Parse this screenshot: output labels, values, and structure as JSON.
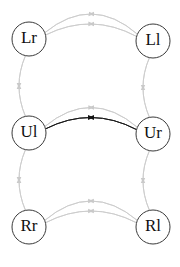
{
  "figure": {
    "title": "",
    "background_color": "#ffffff",
    "width": 180,
    "height": 267
  },
  "chart_data": {
    "type": "diagram",
    "diagram_kind": "directed-graph",
    "title": "",
    "xlabel": "",
    "ylabel": "",
    "grid": false,
    "legend": "none",
    "colors": {
      "node_stroke": "#3a3a3a",
      "node_fill": "#ffffff",
      "node_label": "#101010",
      "edge_inactive": "#cccccc",
      "edge_active": "#1a1a1a"
    },
    "nodes": [
      {
        "id": "Lr",
        "label": "Lr",
        "cx": 29,
        "cy": 39,
        "r": 17,
        "row": "top",
        "col": "left"
      },
      {
        "id": "Ll",
        "label": "Ll",
        "cx": 153,
        "cy": 41,
        "r": 17,
        "row": "top",
        "col": "right"
      },
      {
        "id": "Ul",
        "label": "Ul",
        "cx": 29,
        "cy": 133,
        "r": 17,
        "row": "middle",
        "col": "left"
      },
      {
        "id": "Ur",
        "label": "Ur",
        "cx": 153,
        "cy": 134,
        "r": 17,
        "row": "middle",
        "col": "right"
      },
      {
        "id": "Rr",
        "label": "Rr",
        "cx": 29,
        "cy": 227,
        "r": 17,
        "row": "bottom",
        "col": "left"
      },
      {
        "id": "Rl",
        "label": "Rl",
        "cx": 153,
        "cy": 227,
        "r": 17,
        "row": "bottom",
        "col": "right"
      }
    ],
    "edges": [
      {
        "id": "e1",
        "from": "Lr",
        "to": "Ll",
        "direction": "right",
        "state": "inactive",
        "curve": -26,
        "offset": 0
      },
      {
        "id": "e2",
        "from": "Lr",
        "to": "Ll",
        "direction": "right",
        "state": "inactive",
        "curve": -16,
        "offset": 0
      },
      {
        "id": "e3",
        "from": "Ll",
        "to": "Lr",
        "direction": "left",
        "state": "inactive",
        "curve": 16,
        "offset": 0
      },
      {
        "id": "e4",
        "from": "Ll",
        "to": "Lr",
        "direction": "left",
        "state": "inactive",
        "curve": 26,
        "offset": 0
      },
      {
        "id": "e5",
        "from": "Ul",
        "to": "Ur",
        "direction": "right",
        "state": "inactive",
        "curve": -26,
        "offset": 0
      },
      {
        "id": "e6",
        "from": "Ul",
        "to": "Ur",
        "direction": "right",
        "state": "active",
        "curve": -16,
        "offset": 0
      },
      {
        "id": "e7",
        "from": "Ur",
        "to": "Ul",
        "direction": "left",
        "state": "active",
        "curve": 16,
        "offset": 0
      },
      {
        "id": "e8",
        "from": "Ur",
        "to": "Ul",
        "direction": "left",
        "state": "inactive",
        "curve": 26,
        "offset": 0
      },
      {
        "id": "e9",
        "from": "Rr",
        "to": "Rl",
        "direction": "right",
        "state": "inactive",
        "curve": -26,
        "offset": 0
      },
      {
        "id": "e10",
        "from": "Rr",
        "to": "Rl",
        "direction": "right",
        "state": "inactive",
        "curve": -16,
        "offset": 0
      },
      {
        "id": "e11",
        "from": "Rl",
        "to": "Rr",
        "direction": "left",
        "state": "inactive",
        "curve": 16,
        "offset": 0
      },
      {
        "id": "e12",
        "from": "Rl",
        "to": "Rr",
        "direction": "left",
        "state": "inactive",
        "curve": 26,
        "offset": 0
      },
      {
        "id": "e13",
        "from": "Ul",
        "to": "Lr",
        "direction": "up",
        "state": "inactive",
        "curve": -10,
        "offset": 0
      },
      {
        "id": "e14",
        "from": "Lr",
        "to": "Ul",
        "direction": "down",
        "state": "inactive",
        "curve": 10,
        "offset": 0
      },
      {
        "id": "e15",
        "from": "Ur",
        "to": "Ll",
        "direction": "up",
        "state": "inactive",
        "curve": -10,
        "offset": 0
      },
      {
        "id": "e16",
        "from": "Ll",
        "to": "Ur",
        "direction": "down",
        "state": "inactive",
        "curve": 10,
        "offset": 0
      },
      {
        "id": "e17",
        "from": "Rr",
        "to": "Ul",
        "direction": "up",
        "state": "inactive",
        "curve": -10,
        "offset": 0
      },
      {
        "id": "e18",
        "from": "Ul",
        "to": "Rr",
        "direction": "down",
        "state": "inactive",
        "curve": 10,
        "offset": 0
      },
      {
        "id": "e19",
        "from": "Rl",
        "to": "Ur",
        "direction": "up",
        "state": "inactive",
        "curve": -10,
        "offset": 0
      },
      {
        "id": "e20",
        "from": "Ur",
        "to": "Rl",
        "direction": "down",
        "state": "inactive",
        "curve": 10,
        "offset": 0
      }
    ]
  }
}
